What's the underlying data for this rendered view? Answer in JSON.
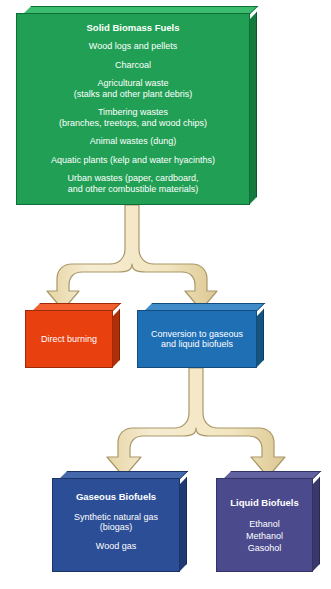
{
  "diagram": {
    "colors": {
      "green": "#21a055",
      "red": "#e8400f",
      "blue": "#1f6fb5",
      "navy": "#2b4e96",
      "purple": "#4a4a8c",
      "arrow_fill": "#f2e5c0",
      "arrow_stroke": "#a89868",
      "text": "#ffffff",
      "background": "#ffffff"
    },
    "nodes": {
      "solid_biomass": {
        "heading": "Solid Biomass Fuels",
        "lines": [
          "Wood logs and pellets",
          "Charcoal",
          "Agricultural waste\n(stalks and other plant debris)",
          "Timbering wastes\n(branches, treetops, and wood chips)",
          "Animal wastes (dung)",
          "Aquatic plants (kelp and water hyacinths)",
          "Urban wastes (paper, cardboard,\nand other combustible materials)"
        ]
      },
      "direct_burning": {
        "heading": "",
        "lines": [
          "Direct burning"
        ]
      },
      "conversion": {
        "heading": "",
        "lines": [
          "Conversion to gaseous\nand liquid biofuels"
        ]
      },
      "gaseous_biofuels": {
        "heading": "Gaseous Biofuels",
        "lines": [
          "Synthetic natural gas\n(biogas)",
          "Wood gas"
        ]
      },
      "liquid_biofuels": {
        "heading": "Liquid Biofuels",
        "lines": [
          "Ethanol\nMethanol\nGasohol"
        ]
      }
    },
    "arrows": [
      {
        "name": "arrow-biomass-to-processes",
        "from": "solid_biomass",
        "to": [
          "direct_burning",
          "conversion"
        ]
      },
      {
        "name": "arrow-conversion-to-biofuels",
        "from": "conversion",
        "to": [
          "gaseous_biofuels",
          "liquid_biofuels"
        ]
      }
    ]
  }
}
